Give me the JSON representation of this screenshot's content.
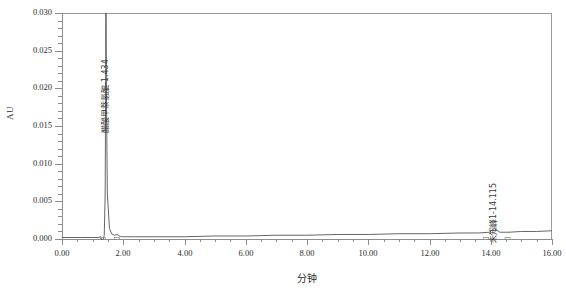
{
  "chart_data": {
    "type": "line",
    "title": "",
    "subtitle": "",
    "xlabel": "分钟",
    "ylabel": "AU",
    "xlim": [
      0.0,
      16.0
    ],
    "ylim": [
      0.0,
      0.03
    ],
    "grid": false,
    "legend": null,
    "x_ticks": [
      "0.00",
      "2.00",
      "4.00",
      "6.00",
      "8.00",
      "10.00",
      "12.00",
      "14.00",
      "16.00"
    ],
    "x_tick_values": [
      0,
      2,
      4,
      6,
      8,
      10,
      12,
      14,
      16
    ],
    "x_minor_step": 0.5,
    "y_ticks": [
      "0.000",
      "0.005",
      "0.010",
      "0.015",
      "0.020",
      "0.025",
      "0.030"
    ],
    "y_tick_values": [
      0.0,
      0.005,
      0.01,
      0.015,
      0.02,
      0.025,
      0.03
    ],
    "y_minor_step": 0.001,
    "series": [
      {
        "name": "chromatogram",
        "color": "#555555",
        "description": "UV absorbance chromatogram baseline near 0.000 AU with one off-scale peak at 1.434 min and a small peak at 14.115 min",
        "x": [
          0.0,
          0.6,
          1.0,
          1.18,
          1.26,
          1.32,
          1.38,
          1.41,
          1.425,
          1.434,
          1.45,
          1.48,
          1.55,
          1.62,
          1.72,
          1.8,
          1.88,
          1.95,
          2.1,
          2.4,
          3.0,
          4.0,
          5.0,
          6.0,
          7.0,
          8.0,
          9.0,
          10.0,
          11.0,
          12.0,
          13.0,
          13.6,
          13.95,
          14.115,
          14.3,
          14.6,
          15.0,
          15.5,
          16.0
        ],
        "y": [
          0.0002,
          0.0002,
          0.0002,
          0.0002,
          0.0003,
          -0.0004,
          0.0005,
          0.006,
          0.02,
          0.034,
          0.02,
          0.006,
          0.0014,
          0.0007,
          0.0005,
          0.0006,
          0.0004,
          0.0003,
          0.0003,
          0.0003,
          0.0003,
          0.0003,
          0.0004,
          0.0004,
          0.0005,
          0.0005,
          0.0006,
          0.0006,
          0.0007,
          0.0007,
          0.0008,
          0.0008,
          0.0009,
          0.0014,
          0.0009,
          0.0009,
          0.001,
          0.001,
          0.0011
        ]
      }
    ],
    "annotations": [
      {
        "id": "peak-1",
        "text": "醋酸甲萘氢醌-1.434",
        "compound": "醋酸甲萘氢醌",
        "retention_time": "1.434",
        "x": 1.434,
        "rotation": -90,
        "off_scale": true
      },
      {
        "id": "peak-2",
        "text": "未知峰1-14.115",
        "compound": "未知峰1",
        "retention_time": "14.115",
        "x": 14.115,
        "rotation": -90,
        "off_scale": false
      }
    ],
    "integration_marks": [
      {
        "x": 1.33,
        "label": "baseline-start-peak-1"
      },
      {
        "x": 1.8,
        "label": "baseline-end-peak-1"
      },
      {
        "x": 13.85,
        "label": "baseline-start-peak-2"
      },
      {
        "x": 14.55,
        "label": "baseline-end-peak-2"
      }
    ]
  },
  "axes": {
    "y_title": "AU",
    "x_title": "分钟"
  }
}
